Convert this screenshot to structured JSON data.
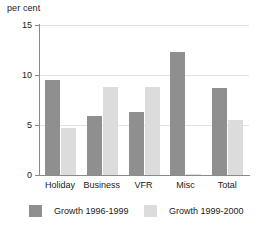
{
  "chart_data": {
    "type": "bar",
    "title": "",
    "subtitle": "",
    "xlabel": "",
    "ylabel": "per cent",
    "ylim": [
      0,
      15
    ],
    "yticks": [
      0,
      5,
      10,
      15
    ],
    "ytick_labels": [
      "0",
      "5",
      "10",
      "15"
    ],
    "grid": true,
    "grid_axis": "y",
    "legend_position": "bottom",
    "categories": [
      "Holiday",
      "Business",
      "VFR",
      "Misc",
      "Total"
    ],
    "series": [
      {
        "name": "Growth 1996-1999",
        "color": "#8f8f8f",
        "values": [
          9.5,
          5.9,
          6.3,
          12.3,
          8.7
        ]
      },
      {
        "name": "Growth 1999-2000",
        "color": "#dcdcdc",
        "values": [
          4.7,
          8.8,
          8.8,
          0.1,
          5.5
        ]
      }
    ]
  },
  "colors": {
    "series_dark": "#8f8f8f",
    "series_light": "#dcdcdc",
    "axis": "#8a8a8a",
    "grid": "#e2e2e2",
    "text": "#1a1a1a",
    "background": "#ffffff"
  }
}
